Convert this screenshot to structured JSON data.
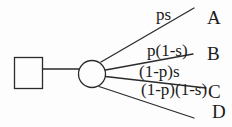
{
  "diagram": {
    "kind": "probability-tree",
    "nodes": {
      "root": {
        "shape": "square"
      },
      "chance": {
        "shape": "circle"
      }
    },
    "branches": [
      {
        "label": "ps",
        "outcome": "A"
      },
      {
        "label": "p(1-s)",
        "outcome": "B"
      },
      {
        "label": "(1-p)s",
        "outcome": "C"
      },
      {
        "label": "(1-p)(1-s)",
        "outcome": "D"
      }
    ],
    "colors": {
      "stroke": "#2b2b2b",
      "text": "#1b1b1b",
      "background": "#fdfdfd"
    }
  }
}
